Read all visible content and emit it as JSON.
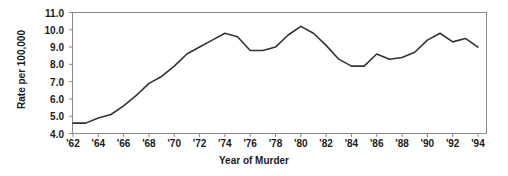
{
  "chart_data": {
    "type": "line",
    "title": "",
    "xlabel": "Year of Murder",
    "ylabel": "Rate per 100,000",
    "xlim": [
      1962,
      1994
    ],
    "ylim": [
      4.0,
      11.0
    ],
    "grid": false,
    "legend": null,
    "xtick_labels": [
      "'62",
      "'64",
      "'66",
      "'68",
      "'70",
      "'72",
      "'74",
      "'76",
      "'78",
      "'80",
      "'82",
      "'84",
      "'86",
      "'88",
      "'90",
      "'92",
      "'94"
    ],
    "xtick_values": [
      1962,
      1964,
      1966,
      1968,
      1970,
      1972,
      1974,
      1976,
      1978,
      1980,
      1982,
      1984,
      1986,
      1988,
      1990,
      1992,
      1994
    ],
    "ytick_labels": [
      "4.0",
      "5.0",
      "6.0",
      "7.0",
      "8.0",
      "9.0",
      "10.0",
      "11.0"
    ],
    "ytick_values": [
      4.0,
      5.0,
      6.0,
      7.0,
      8.0,
      9.0,
      10.0,
      11.0
    ],
    "series": [
      {
        "name": "Murder rate",
        "color": "#333333",
        "x": [
          1962,
          1963,
          1964,
          1965,
          1966,
          1967,
          1968,
          1969,
          1970,
          1971,
          1972,
          1973,
          1974,
          1975,
          1976,
          1977,
          1978,
          1979,
          1980,
          1981,
          1982,
          1983,
          1984,
          1985,
          1986,
          1987,
          1988,
          1989,
          1990,
          1991,
          1992,
          1993,
          1994
        ],
        "values": [
          4.6,
          4.6,
          4.9,
          5.1,
          5.6,
          6.2,
          6.9,
          7.3,
          7.9,
          8.6,
          9.0,
          9.4,
          9.8,
          9.6,
          8.8,
          8.8,
          9.0,
          9.7,
          10.2,
          9.8,
          9.1,
          8.3,
          7.9,
          7.9,
          8.6,
          8.3,
          8.4,
          8.7,
          9.4,
          9.8,
          9.3,
          9.5,
          9.0
        ]
      }
    ]
  }
}
